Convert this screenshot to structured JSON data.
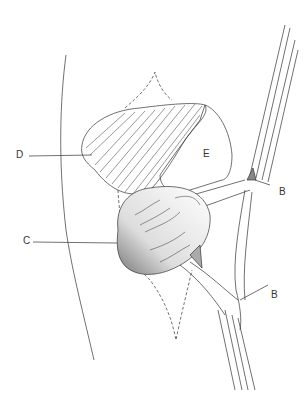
{
  "diagram": {
    "type": "anatomical surgical illustration",
    "labels": [
      {
        "id": "D",
        "text": "D",
        "x": 16,
        "y": 155
      },
      {
        "id": "E",
        "text": "E",
        "x": 203,
        "y": 148
      },
      {
        "id": "C",
        "text": "C",
        "x": 23,
        "y": 240
      },
      {
        "id": "B1",
        "text": "B",
        "x": 279,
        "y": 188
      },
      {
        "id": "B2",
        "text": "B",
        "x": 271,
        "y": 290
      }
    ]
  }
}
